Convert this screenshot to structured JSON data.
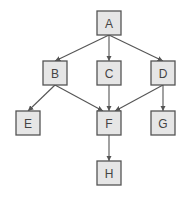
{
  "diagram": {
    "type": "directed-graph",
    "nodes": [
      {
        "id": "A",
        "label": "A"
      },
      {
        "id": "B",
        "label": "B"
      },
      {
        "id": "C",
        "label": "C"
      },
      {
        "id": "D",
        "label": "D"
      },
      {
        "id": "E",
        "label": "E"
      },
      {
        "id": "F",
        "label": "F"
      },
      {
        "id": "G",
        "label": "G"
      },
      {
        "id": "H",
        "label": "H"
      }
    ],
    "edges": [
      {
        "from": "A",
        "to": "B"
      },
      {
        "from": "A",
        "to": "C"
      },
      {
        "from": "A",
        "to": "D"
      },
      {
        "from": "B",
        "to": "E"
      },
      {
        "from": "B",
        "to": "F"
      },
      {
        "from": "C",
        "to": "F"
      },
      {
        "from": "D",
        "to": "F"
      },
      {
        "from": "D",
        "to": "G"
      },
      {
        "from": "F",
        "to": "H"
      }
    ],
    "colors": {
      "node_fill": "#e6e6e6",
      "node_stroke": "#555555",
      "edge": "#555555",
      "label": "#444444"
    }
  }
}
